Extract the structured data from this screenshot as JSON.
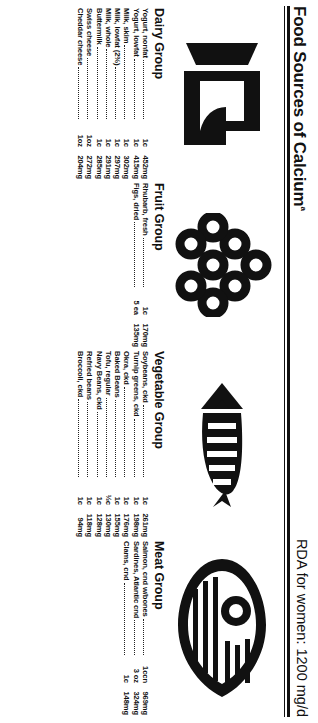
{
  "header": {
    "title": "Food Sources of Calcium",
    "title_superscript": "a",
    "rda": "RDA for women: 1200 mg/d"
  },
  "columns": [
    {
      "key": "dairy",
      "group_title": "Dairy Group",
      "icon": "milk-carton-icon",
      "items": [
        {
          "name": "Yogurt, nonfat",
          "amount": "1c",
          "value": "452mg"
        },
        {
          "name": "Yogurt, lowfat",
          "amount": "1c",
          "value": "415mg"
        },
        {
          "name": "Milk, skim",
          "amount": "1c",
          "value": "302mg"
        },
        {
          "name": "Milk, lowfat (2%)",
          "amount": "1c",
          "value": "297mg"
        },
        {
          "name": "Milk, whole",
          "amount": "1c",
          "value": "291mg"
        },
        {
          "name": "Buttermilk",
          "amount": "1c",
          "value": "285mg"
        },
        {
          "name": "Swiss cheese",
          "amount": "1oz",
          "value": "272mg"
        },
        {
          "name": "Cheddar cheese",
          "amount": "1oz",
          "value": "204mg"
        }
      ]
    },
    {
      "key": "fruit",
      "group_title": "Fruit Group",
      "icon": "grapes-icon",
      "items": [
        {
          "name": "Rhubarb, fresh",
          "amount": "1c",
          "value": "170mg"
        },
        {
          "name": "Figs, dried",
          "amount": "5 ea",
          "value": "135mg"
        }
      ]
    },
    {
      "key": "vegetable",
      "group_title": "Vegetable Group",
      "icon": "carrot-icon",
      "items": [
        {
          "name": "Soybeans, ckd",
          "amount": "1c",
          "value": "261mg"
        },
        {
          "name": "Turnip greens, ckd",
          "amount": "1c",
          "value": "198mg"
        },
        {
          "name": "Okra, ckd",
          "amount": "1c",
          "value": "176mg"
        },
        {
          "name": "Baked Beans",
          "amount": "1c",
          "value": "155mg"
        },
        {
          "name": "Tofu, regular",
          "amount": "½c",
          "value": "130mg"
        },
        {
          "name": "Navy Beans, ckd",
          "amount": "1c",
          "value": "128mg"
        },
        {
          "name": "Refried beans",
          "amount": "1c",
          "value": "118mg"
        },
        {
          "name": "Broccoli, ckd",
          "amount": "1c",
          "value": "94mg"
        }
      ]
    },
    {
      "key": "meat",
      "group_title": "Meat Group",
      "icon": "fish-icon",
      "items": [
        {
          "name": "Salmon, cnd w/bones",
          "amount": "1ccn",
          "value": "969mg"
        },
        {
          "name": "Sardines, Atlantic cnd",
          "amount": "3 oz",
          "value": "324mg"
        },
        {
          "name": "Clams, cnd",
          "amount": "1c",
          "value": "148mg"
        }
      ]
    }
  ],
  "colors": {
    "ink": "#111111",
    "paper": "#ffffff"
  }
}
